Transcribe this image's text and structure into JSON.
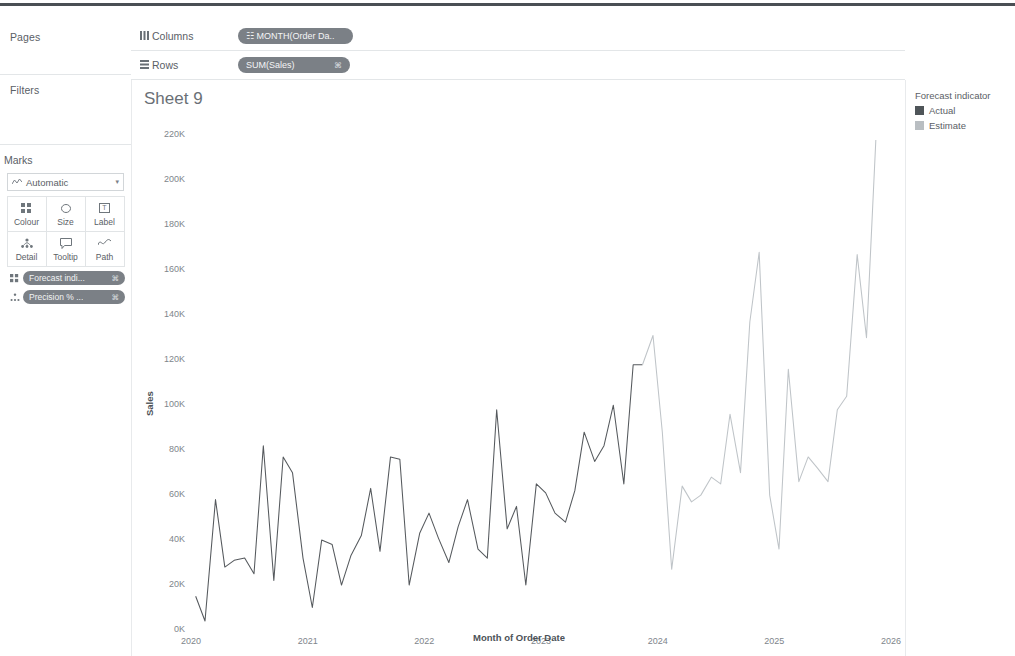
{
  "window": {
    "top_rule_color": "#4a4f54"
  },
  "left_panel": {
    "pages_label": "Pages",
    "filters_label": "Filters",
    "marks_label": "Marks",
    "mark_type": {
      "icon": "line-mark-icon",
      "label": "Automatic",
      "caret": "▾"
    },
    "buttons": [
      {
        "name": "colour",
        "label": "Colour",
        "icon": "colour-icon"
      },
      {
        "name": "size",
        "label": "Size",
        "icon": "size-icon"
      },
      {
        "name": "label",
        "label": "Label",
        "icon": "label-icon"
      },
      {
        "name": "detail",
        "label": "Detail",
        "icon": "detail-icon"
      },
      {
        "name": "tooltip",
        "label": "Tooltip",
        "icon": "tooltip-icon"
      },
      {
        "name": "path",
        "label": "Path",
        "icon": "path-icon"
      }
    ],
    "card_pills": [
      {
        "icon": "colour-icon",
        "text": "Forecast indi...",
        "tag": "⌘"
      },
      {
        "icon": "path-icon",
        "text": "Precision % ...",
        "tag": "⌘"
      }
    ]
  },
  "shelves": [
    {
      "name": "columns",
      "icon": "columns-icon",
      "label": "Columns",
      "pill": {
        "text": "☷ MONTH(Order Da..",
        "tag": ""
      }
    },
    {
      "name": "rows",
      "icon": "rows-icon",
      "label": "Rows",
      "pill": {
        "text": "SUM(Sales)",
        "tag": "⌘"
      }
    }
  ],
  "sheet": {
    "title": "Sheet 9"
  },
  "legend": {
    "title": "Forecast indicator",
    "items": [
      {
        "label": "Actual",
        "colour": "#4f5559"
      },
      {
        "label": "Estimate",
        "colour": "#b9bec2"
      }
    ]
  },
  "chart_data": {
    "type": "line",
    "title": "Sheet 9",
    "xlabel": "Month of Order Date",
    "ylabel": "Sales",
    "grid": false,
    "legend_position": "right",
    "xlim": [
      2020.0,
      2026.0
    ],
    "ylim": [
      0,
      230000
    ],
    "ytick_labels": [
      "0K",
      "20K",
      "40K",
      "60K",
      "80K",
      "100K",
      "120K",
      "140K",
      "160K",
      "180K",
      "200K",
      "220K"
    ],
    "ytick_values": [
      0,
      20000,
      40000,
      60000,
      80000,
      100000,
      120000,
      140000,
      160000,
      180000,
      200000,
      220000
    ],
    "xtick_labels": [
      "2020",
      "2021",
      "2022",
      "2023",
      "2024",
      "2025",
      "2026"
    ],
    "xtick_values": [
      2020,
      2021,
      2022,
      2023,
      2024,
      2025,
      2026
    ],
    "series": [
      {
        "name": "Actual",
        "colour": "#55595d",
        "x": [
          2020.04,
          2020.12,
          2020.21,
          2020.29,
          2020.37,
          2020.46,
          2020.54,
          2020.62,
          2020.71,
          2020.79,
          2020.87,
          2020.96,
          2021.04,
          2021.12,
          2021.21,
          2021.29,
          2021.37,
          2021.46,
          2021.54,
          2021.62,
          2021.71,
          2021.79,
          2021.87,
          2021.96,
          2022.04,
          2022.12,
          2022.21,
          2022.29,
          2022.37,
          2022.46,
          2022.54,
          2022.62,
          2022.71,
          2022.79,
          2022.87,
          2022.96,
          2023.04,
          2023.12,
          2023.21,
          2023.29,
          2023.37,
          2023.46,
          2023.54,
          2023.62,
          2023.71,
          2023.79,
          2023.87
        ],
        "y": [
          15000,
          4000,
          58000,
          28000,
          31000,
          32000,
          25000,
          82000,
          22000,
          77000,
          70000,
          32000,
          10000,
          40000,
          38000,
          20000,
          33000,
          42000,
          63000,
          35000,
          77000,
          76000,
          20000,
          43000,
          52000,
          41000,
          30000,
          46000,
          58000,
          36000,
          32000,
          98000,
          45000,
          55000,
          20000,
          65000,
          61000,
          52000,
          48000,
          62000,
          88000,
          75000,
          82000,
          100000,
          65000,
          118000,
          118000
        ]
      },
      {
        "name": "Estimate",
        "colour": "#bfc4c8",
        "x": [
          2023.87,
          2023.96,
          2024.04,
          2024.12,
          2024.21,
          2024.29,
          2024.37,
          2024.46,
          2024.54,
          2024.62,
          2024.71,
          2024.79,
          2024.87,
          2024.96,
          2025.04,
          2025.12,
          2025.21,
          2025.29,
          2025.37,
          2025.46,
          2025.54,
          2025.62,
          2025.71,
          2025.79,
          2025.87
        ],
        "y": [
          118000,
          131000,
          88000,
          27000,
          64000,
          57000,
          60000,
          68000,
          65000,
          96000,
          70000,
          137000,
          168000,
          60000,
          36000,
          116000,
          66000,
          77000,
          72000,
          66000,
          98000,
          104000,
          167000,
          130000,
          218000
        ]
      }
    ]
  }
}
